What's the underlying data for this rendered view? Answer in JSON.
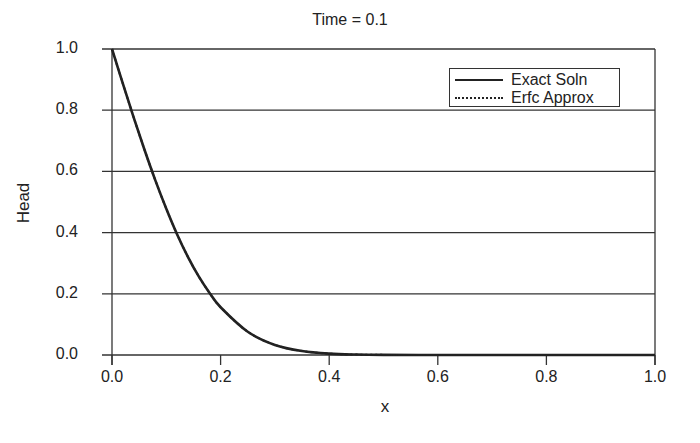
{
  "chart_data": {
    "type": "line",
    "title": "Time = 0.1",
    "xlabel": "x",
    "ylabel": "Head",
    "xlim": [
      0.0,
      1.0
    ],
    "ylim": [
      0.0,
      1.0
    ],
    "xticks": [
      "0.0",
      "0.2",
      "0.4",
      "0.6",
      "0.8",
      "1.0"
    ],
    "yticks": [
      "0.0",
      "0.2",
      "0.4",
      "0.6",
      "0.8",
      "1.0"
    ],
    "grid": "horizontal",
    "legend_position": "upper right",
    "x": [
      0.0,
      0.02,
      0.04,
      0.06,
      0.08,
      0.1,
      0.12,
      0.14,
      0.16,
      0.18,
      0.2,
      0.25,
      0.3,
      0.35,
      0.4,
      0.45,
      0.5,
      0.6,
      0.7,
      0.8,
      0.9,
      1.0
    ],
    "series": [
      {
        "name": "Exact Soln",
        "style": "solid",
        "values": [
          1.0,
          0.887,
          0.776,
          0.67,
          0.57,
          0.478,
          0.394,
          0.32,
          0.256,
          0.202,
          0.156,
          0.076,
          0.033,
          0.013,
          0.0044,
          0.0014,
          0.0004,
          0.0,
          0.0,
          0.0,
          0.0,
          0.0
        ]
      },
      {
        "name": "Erfc Approx",
        "style": "dotted",
        "values": [
          1.0,
          0.887,
          0.776,
          0.67,
          0.57,
          0.478,
          0.394,
          0.32,
          0.256,
          0.202,
          0.156,
          0.076,
          0.033,
          0.013,
          0.0044,
          0.0014,
          0.0004,
          0.0,
          0.0,
          0.0,
          0.0,
          0.0
        ]
      }
    ]
  },
  "colors": {
    "line": "#222222",
    "grid": "#333333",
    "background": "#ffffff"
  }
}
